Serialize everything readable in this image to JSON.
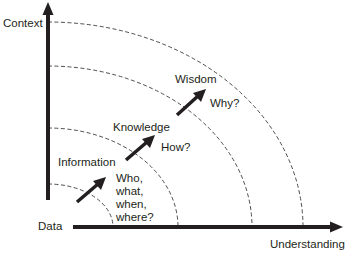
{
  "diagram": {
    "axes": {
      "y_label": "Context",
      "x_label": "Understanding",
      "origin_label": "Data"
    },
    "levels": [
      {
        "name": "Data",
        "question": ""
      },
      {
        "name": "Information",
        "question": "Who,\nwhat,\nwhen,\nwhere?"
      },
      {
        "name": "Knowledge",
        "question": "How?"
      },
      {
        "name": "Wisdom",
        "question": "Why?"
      }
    ],
    "colors": {
      "ink": "#231f20",
      "background": "#ffffff"
    }
  }
}
